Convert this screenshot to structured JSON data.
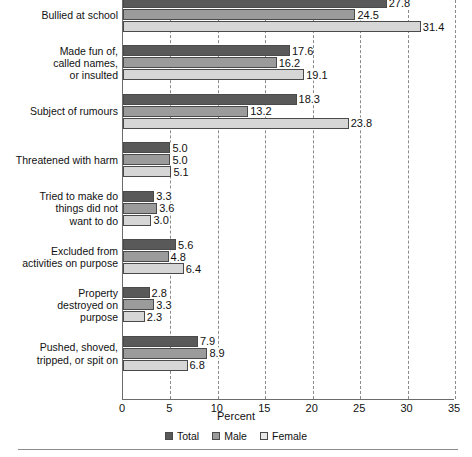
{
  "chart_data": {
    "type": "bar",
    "orientation": "horizontal",
    "title": "",
    "xlabel": "Percent",
    "ylabel": "",
    "xlim": [
      0,
      35
    ],
    "xticks": [
      "0",
      "5",
      "10",
      "15",
      "20",
      "25",
      "30",
      "35"
    ],
    "grid": true,
    "legend_position": "bottom",
    "categories": [
      "Bullied at school",
      "Made fun of,\ncalled names,\nor insulted",
      "Subject of rumours",
      "Threatened with harm",
      "Tried to make do\nthings did not\nwant to do",
      "Excluded from\nactivities on purpose",
      "Property\ndestroyed on\npurpose",
      "Pushed, shoved,\ntripped, or spit on"
    ],
    "series": [
      {
        "name": "Total",
        "color": "#595959",
        "values": [
          27.8,
          17.6,
          18.3,
          5.0,
          3.3,
          5.6,
          2.8,
          7.9
        ]
      },
      {
        "name": "Male",
        "color": "#9b9b9b",
        "values": [
          24.5,
          16.2,
          13.2,
          5.0,
          3.6,
          4.8,
          3.3,
          8.9
        ]
      },
      {
        "name": "Female",
        "color": "#d6d6d6",
        "values": [
          31.4,
          19.1,
          23.8,
          5.1,
          3.0,
          6.4,
          2.3,
          6.8
        ]
      }
    ],
    "value_labels": [
      [
        "27.8",
        "24.5",
        "31.4"
      ],
      [
        "17.6",
        "16.2",
        "19.1"
      ],
      [
        "18.3",
        "13.2",
        "23.8"
      ],
      [
        "5.0",
        "5.0",
        "5.1"
      ],
      [
        "3.3",
        "3.6",
        "3.0"
      ],
      [
        "5.6",
        "4.8",
        "6.4"
      ],
      [
        "2.8",
        "3.3",
        "2.3"
      ],
      [
        "7.9",
        "8.9",
        "6.8"
      ]
    ]
  },
  "legend": {
    "items": [
      {
        "label": "Total"
      },
      {
        "label": "Male"
      },
      {
        "label": "Female"
      }
    ]
  },
  "axis": {
    "x_title": "Percent"
  }
}
